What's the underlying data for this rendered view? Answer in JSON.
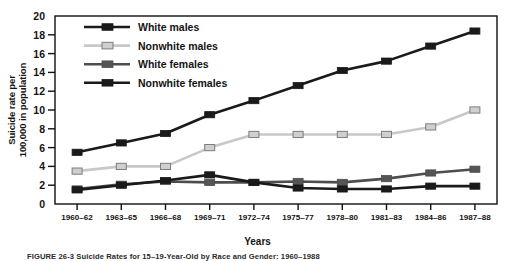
{
  "figure": {
    "caption_number": "FIGURE 26-3",
    "caption_text": "Suicide Rates for 15–19-Year-Old by Race and Gender: 1960–1988"
  },
  "chart_data": {
    "type": "line",
    "title": "",
    "xlabel": "Years",
    "ylabel": "Suicide rate per 100,000 in population",
    "ylabel_lines": [
      "Suicide rate per",
      "100,000 in population"
    ],
    "categories": [
      "1960–62",
      "1963–65",
      "1966–68",
      "1969–71",
      "1972–74",
      "1975–77",
      "1978–80",
      "1981–83",
      "1984–86",
      "1987–88"
    ],
    "yticks": [
      0,
      2,
      4,
      6,
      8,
      10,
      12,
      14,
      16,
      18,
      20
    ],
    "ylim": [
      0,
      20
    ],
    "grid": false,
    "legend_position": "upper-left-inside",
    "series": [
      {
        "name": "White males",
        "color": "#1a1a1a",
        "marker_fill": "#1a1a1a",
        "values": [
          5.5,
          6.5,
          7.5,
          9.5,
          11.0,
          12.6,
          14.2,
          15.2,
          16.8,
          18.4
        ]
      },
      {
        "name": "Nonwhite males",
        "color": "#c8c8c8",
        "marker_fill": "#cfcfcf",
        "values": [
          3.5,
          4.0,
          4.0,
          6.0,
          7.4,
          7.4,
          7.4,
          7.4,
          8.2,
          10.0
        ]
      },
      {
        "name": "White females",
        "color": "#4d4d4d",
        "marker_fill": "#555555",
        "values": [
          1.6,
          2.1,
          2.4,
          2.3,
          2.3,
          2.4,
          2.3,
          2.7,
          3.3,
          3.7
        ]
      },
      {
        "name": "Nonwhite females",
        "color": "#1a1a1a",
        "marker_fill": "#1a1a1a",
        "values": [
          1.5,
          2.0,
          2.5,
          3.1,
          2.3,
          1.7,
          1.6,
          1.6,
          1.9,
          1.9
        ]
      }
    ]
  }
}
